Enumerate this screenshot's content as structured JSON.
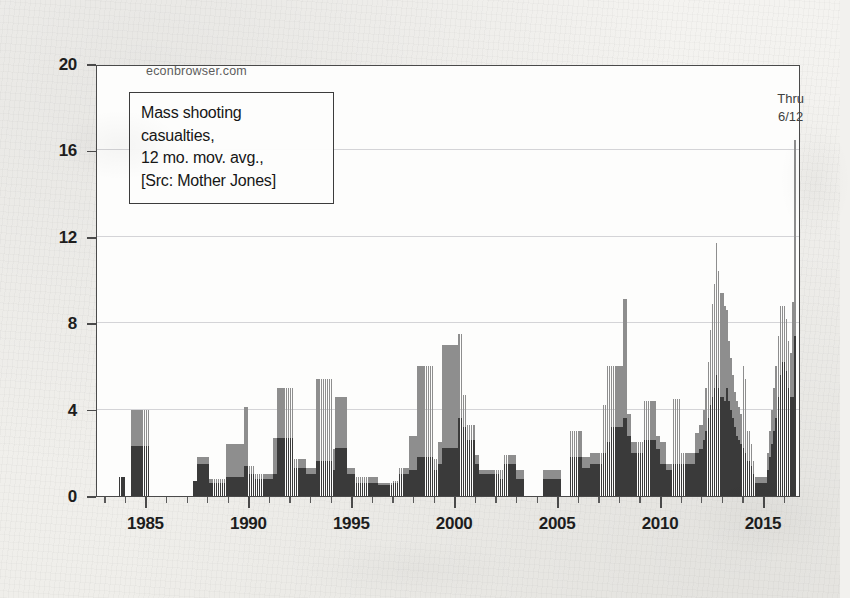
{
  "watermark": "econbrowser.com",
  "annotation": {
    "line1": "Mass shooting",
    "line2": "casualties,",
    "line3": "12 mo. mov. avg.,",
    "line4": "[Src: Mother Jones]"
  },
  "thru_note": {
    "line1": "Thru",
    "line2": "6/12"
  },
  "colors": {
    "fatalities": "#3a3a3a",
    "injuries": "#8e8e8e",
    "axis": "#4a4a4a",
    "grid": "#9a9aa4",
    "paper": "#f2f1ee",
    "plot_background": "#fdfdfc"
  },
  "chart_data": {
    "type": "bar",
    "stacked": true,
    "title": "Mass shooting casualties, 12 mo. mov. avg.",
    "subtitle": "[Src: Mother Jones]",
    "source": "Mother Jones",
    "publisher": "econbrowser.com",
    "annotation_note": "Thru 6/12",
    "xlabel": "",
    "ylabel": "",
    "xlim": [
      1982.6,
      2016.8
    ],
    "ylim": [
      0,
      20
    ],
    "yticks": [
      0,
      4,
      8,
      12,
      16,
      20
    ],
    "xticks": [
      1985,
      1990,
      1995,
      2000,
      2005,
      2010,
      2015
    ],
    "x_minor_tick_interval": 1,
    "grid": "horizontal",
    "legend": "none",
    "bar_interval_years": 0.0833,
    "series": [
      {
        "name": "fatalities",
        "color": "#3a3a3a",
        "stack_order": 0
      },
      {
        "name": "injuries",
        "color": "#8e8e8e",
        "stack_order": 1
      }
    ],
    "x": [
      1983.0,
      1983.1,
      1983.2,
      1983.3,
      1983.4,
      1983.5,
      1983.6,
      1983.7,
      1983.8,
      1983.9,
      1984.0,
      1984.1,
      1984.2,
      1984.3,
      1984.4,
      1984.5,
      1984.6,
      1984.7,
      1984.8,
      1984.9,
      1985.0,
      1985.1,
      1985.2,
      1985.3,
      1985.4,
      1985.5,
      1985.6,
      1985.7,
      1985.8,
      1985.9,
      1986.0,
      1986.1,
      1986.2,
      1986.3,
      1986.4,
      1986.5,
      1986.6,
      1986.7,
      1986.8,
      1986.9,
      1987.0,
      1987.1,
      1987.2,
      1987.3,
      1987.4,
      1987.5,
      1987.6,
      1987.7,
      1987.8,
      1987.9,
      1988.0,
      1988.1,
      1988.2,
      1988.3,
      1988.4,
      1988.5,
      1988.6,
      1988.7,
      1988.8,
      1988.9,
      1989.0,
      1989.1,
      1989.2,
      1989.3,
      1989.4,
      1989.5,
      1989.6,
      1989.7,
      1989.8,
      1989.9,
      1990.0,
      1990.1,
      1990.2,
      1990.3,
      1990.4,
      1990.5,
      1990.6,
      1990.7,
      1990.8,
      1990.9,
      1991.0,
      1991.1,
      1991.2,
      1991.3,
      1991.4,
      1991.5,
      1991.6,
      1991.7,
      1991.8,
      1991.9,
      1992.0,
      1992.1,
      1992.2,
      1992.3,
      1992.4,
      1992.5,
      1992.6,
      1992.7,
      1992.8,
      1992.9,
      1993.0,
      1993.1,
      1993.2,
      1993.3,
      1993.4,
      1993.5,
      1993.6,
      1993.7,
      1993.8,
      1993.9,
      1994.0,
      1994.1,
      1994.2,
      1994.3,
      1994.4,
      1994.5,
      1994.6,
      1994.7,
      1994.8,
      1994.9,
      1995.0,
      1995.1,
      1995.2,
      1995.3,
      1995.4,
      1995.5,
      1995.6,
      1995.7,
      1995.8,
      1995.9,
      1996.0,
      1996.1,
      1996.2,
      1996.3,
      1996.4,
      1996.5,
      1996.6,
      1996.7,
      1996.8,
      1996.9,
      1997.0,
      1997.1,
      1997.2,
      1997.3,
      1997.4,
      1997.5,
      1997.6,
      1997.7,
      1997.8,
      1997.9,
      1998.0,
      1998.1,
      1998.2,
      1998.3,
      1998.4,
      1998.5,
      1998.6,
      1998.7,
      1998.8,
      1998.9,
      1999.0,
      1999.1,
      1999.2,
      1999.3,
      1999.4,
      1999.5,
      1999.6,
      1999.7,
      1999.8,
      1999.9,
      2000.0,
      2000.1,
      2000.2,
      2000.3,
      2000.4,
      2000.5,
      2000.6,
      2000.7,
      2000.8,
      2000.9,
      2001.0,
      2001.1,
      2001.2,
      2001.3,
      2001.4,
      2001.5,
      2001.6,
      2001.7,
      2001.8,
      2001.9,
      2002.0,
      2002.1,
      2002.2,
      2002.3,
      2002.4,
      2002.5,
      2002.6,
      2002.7,
      2002.8,
      2002.9,
      2003.0,
      2003.1,
      2003.2,
      2003.3,
      2003.4,
      2003.5,
      2003.6,
      2003.7,
      2003.8,
      2003.9,
      2004.0,
      2004.1,
      2004.2,
      2004.3,
      2004.4,
      2004.5,
      2004.6,
      2004.7,
      2004.8,
      2004.9,
      2005.0,
      2005.1,
      2005.2,
      2005.3,
      2005.4,
      2005.5,
      2005.6,
      2005.7,
      2005.8,
      2005.9,
      2006.0,
      2006.1,
      2006.2,
      2006.3,
      2006.4,
      2006.5,
      2006.6,
      2006.7,
      2006.8,
      2006.9,
      2007.0,
      2007.1,
      2007.2,
      2007.3,
      2007.4,
      2007.5,
      2007.6,
      2007.7,
      2007.8,
      2007.9,
      2008.0,
      2008.1,
      2008.2,
      2008.3,
      2008.4,
      2008.5,
      2008.6,
      2008.7,
      2008.8,
      2008.9,
      2009.0,
      2009.1,
      2009.2,
      2009.3,
      2009.4,
      2009.5,
      2009.6,
      2009.7,
      2009.8,
      2009.9,
      2010.0,
      2010.1,
      2010.2,
      2010.3,
      2010.4,
      2010.5,
      2010.6,
      2010.7,
      2010.8,
      2010.9,
      2011.0,
      2011.1,
      2011.2,
      2011.3,
      2011.4,
      2011.5,
      2011.6,
      2011.7,
      2011.8,
      2011.9,
      2012.0,
      2012.1,
      2012.2,
      2012.3,
      2012.4,
      2012.5,
      2012.6,
      2012.7,
      2012.8,
      2012.9,
      2013.0,
      2013.1,
      2013.2,
      2013.3,
      2013.4,
      2013.5,
      2013.6,
      2013.7,
      2013.8,
      2013.9,
      2014.0,
      2014.1,
      2014.2,
      2014.3,
      2014.4,
      2014.5,
      2014.6,
      2014.7,
      2014.8,
      2014.9,
      2015.0,
      2015.1,
      2015.2,
      2015.3,
      2015.4,
      2015.5,
      2015.6,
      2015.7,
      2015.8,
      2015.9,
      2016.0,
      2016.1,
      2016.2,
      2016.3,
      2016.4,
      2016.5
    ],
    "fatalities": [
      0,
      0,
      0,
      0,
      0,
      0,
      0,
      0.9,
      0.9,
      0.9,
      0,
      0,
      0,
      2.3,
      2.3,
      2.3,
      2.3,
      2.3,
      2.3,
      2.3,
      2.3,
      2.3,
      0,
      0,
      0,
      0,
      0,
      0,
      0,
      0,
      0,
      0,
      0,
      0,
      0,
      0,
      0,
      0,
      0,
      0,
      0,
      0,
      0,
      0.7,
      0.7,
      1.5,
      1.5,
      1.5,
      1.5,
      1.5,
      1.5,
      0.6,
      0.6,
      0.6,
      0.6,
      0.6,
      0.6,
      0.6,
      0.6,
      0.9,
      0.9,
      0.9,
      0.9,
      0.9,
      0.9,
      0.9,
      0.9,
      0.9,
      1.4,
      1.4,
      1.0,
      1.0,
      1.0,
      0.8,
      0.8,
      0.8,
      0.8,
      0.8,
      0.8,
      0.8,
      0.8,
      0.8,
      1.0,
      1.0,
      2.7,
      2.7,
      2.7,
      2.7,
      2.7,
      2.7,
      2.7,
      2.7,
      1.3,
      1.3,
      1.3,
      1.3,
      1.3,
      1.3,
      1.0,
      1.0,
      1.0,
      1.0,
      1.0,
      1.6,
      1.6,
      1.6,
      1.6,
      1.6,
      1.6,
      1.6,
      1.6,
      1.2,
      2.2,
      2.2,
      2.2,
      2.2,
      2.2,
      2.2,
      1.0,
      1.0,
      1.0,
      1.0,
      0.6,
      0.6,
      0.6,
      0.6,
      0.6,
      0.6,
      0.6,
      0.6,
      0.6,
      0.6,
      0.6,
      0.5,
      0.5,
      0.5,
      0.5,
      0.5,
      0.5,
      0.5,
      0.6,
      0.6,
      0.6,
      1.0,
      1.0,
      1.0,
      1.0,
      1.0,
      1.2,
      1.2,
      1.2,
      1.2,
      1.8,
      1.8,
      1.8,
      1.8,
      1.8,
      1.8,
      1.8,
      1.8,
      1.2,
      1.2,
      1.5,
      1.5,
      2.2,
      2.2,
      2.2,
      2.2,
      2.2,
      2.2,
      2.2,
      2.2,
      3.6,
      3.6,
      3.2,
      3.2,
      2.6,
      2.6,
      2.6,
      2.6,
      1.5,
      1.5,
      1.0,
      1.0,
      1.0,
      1.0,
      1.0,
      1.0,
      1.0,
      1.0,
      1.0,
      1.0,
      0.8,
      0.8,
      1.5,
      1.5,
      1.5,
      1.5,
      1.5,
      1.5,
      0.8,
      0.8,
      0.8,
      0.8,
      0,
      0,
      0,
      0,
      0,
      0,
      0,
      0,
      0,
      0.8,
      0.8,
      0.8,
      0.8,
      0.8,
      0.8,
      0.8,
      0.8,
      0.8,
      0,
      0,
      0,
      0,
      1.8,
      1.8,
      1.8,
      1.8,
      1.8,
      1.8,
      1.3,
      1.3,
      1.3,
      1.3,
      1.5,
      1.5,
      1.5,
      1.5,
      1.5,
      1.5,
      2.0,
      2.0,
      2.5,
      2.5,
      3.2,
      3.2,
      3.2,
      3.2,
      3.2,
      3.2,
      3.6,
      3.6,
      2.8,
      2.8,
      2.0,
      2.0,
      2.0,
      2.0,
      2.0,
      2.0,
      2.6,
      2.6,
      2.6,
      2.6,
      2.6,
      2.6,
      2.2,
      2.2,
      1.5,
      1.5,
      1.5,
      1.2,
      1.2,
      1.2,
      1.5,
      1.5,
      1.5,
      1.5,
      1.5,
      1.5,
      1.5,
      1.5,
      1.5,
      1.5,
      1.5,
      2.0,
      2.0,
      2.2,
      2.2,
      2.6,
      3.0,
      3.6,
      4.2,
      4.6,
      5.0,
      5.6,
      5.0,
      4.6,
      4.6,
      4.4,
      5.0,
      4.4,
      4.0,
      3.6,
      3.2,
      2.8,
      2.6,
      2.4,
      2.2,
      2.0,
      1.6,
      1.6,
      1.4,
      1.0,
      0.6,
      0.6,
      0.6,
      0.6,
      0.6,
      0.6,
      1.2,
      1.8,
      2.4,
      3.0,
      3.6,
      4.6,
      5.6,
      6.2,
      6.2,
      5.8,
      5.0,
      4.6,
      4.6,
      7.4
    ],
    "injuries": [
      0,
      0,
      0,
      0,
      0,
      0,
      0,
      0,
      0,
      0,
      0,
      0,
      0,
      1.7,
      1.7,
      1.7,
      1.7,
      1.7,
      1.7,
      1.7,
      1.7,
      1.7,
      0,
      0,
      0,
      0,
      0,
      0,
      0,
      0,
      0,
      0,
      0,
      0,
      0,
      0,
      0,
      0,
      0,
      0,
      0,
      0,
      0,
      0,
      0,
      0.3,
      0.3,
      0.3,
      0.3,
      0.3,
      0.3,
      0.2,
      0.2,
      0.2,
      0.2,
      0.2,
      0.2,
      0.2,
      0.2,
      1.5,
      1.5,
      1.5,
      1.5,
      1.5,
      1.5,
      1.5,
      1.5,
      1.5,
      2.7,
      2.7,
      0.4,
      0.4,
      0.4,
      0.2,
      0.2,
      0.2,
      0.2,
      0.2,
      0.2,
      0.2,
      0.2,
      0.2,
      1.7,
      1.7,
      2.3,
      2.3,
      2.3,
      2.3,
      2.3,
      2.3,
      2.3,
      2.3,
      0.4,
      0.4,
      0.4,
      0.4,
      0.4,
      0.4,
      0.3,
      0.3,
      0.3,
      0.3,
      0.3,
      3.8,
      3.8,
      3.8,
      3.8,
      3.8,
      3.8,
      3.8,
      3.8,
      1.0,
      2.4,
      2.4,
      2.4,
      2.4,
      2.4,
      2.4,
      0.3,
      0.3,
      0.3,
      0.3,
      0.3,
      0.3,
      0.3,
      0.3,
      0.3,
      0.3,
      0.3,
      0.3,
      0.3,
      0.3,
      0.3,
      0.1,
      0.1,
      0.1,
      0.1,
      0.1,
      0.1,
      0.1,
      0.1,
      0.1,
      0.1,
      0.3,
      0.3,
      0.3,
      0.3,
      0.3,
      1.6,
      1.6,
      1.6,
      1.6,
      4.2,
      4.2,
      4.2,
      4.2,
      4.2,
      4.2,
      4.2,
      4.2,
      0.5,
      0.5,
      1.0,
      1.0,
      4.8,
      4.8,
      4.8,
      4.8,
      4.8,
      4.8,
      4.8,
      4.8,
      3.9,
      3.9,
      1.5,
      1.5,
      0.7,
      0.7,
      0.7,
      0.7,
      0.4,
      0.4,
      0.2,
      0.2,
      0.2,
      0.2,
      0.2,
      0.2,
      0.2,
      0.2,
      0.2,
      0.2,
      0.4,
      0.4,
      0.4,
      0.4,
      0.4,
      0.4,
      0.4,
      0.4,
      0.4,
      0.4,
      0.4,
      0.4,
      0,
      0,
      0,
      0,
      0,
      0,
      0,
      0,
      0,
      0.4,
      0.4,
      0.4,
      0.4,
      0.4,
      0.4,
      0.4,
      0.4,
      0.4,
      0,
      0,
      0,
      0,
      1.2,
      1.2,
      1.2,
      1.2,
      1.2,
      1.2,
      0.5,
      0.5,
      0.5,
      0.5,
      0.5,
      0.5,
      0.5,
      0.5,
      0.5,
      0.5,
      2.2,
      2.2,
      3.5,
      3.5,
      2.8,
      2.8,
      2.8,
      2.8,
      2.8,
      2.8,
      5.5,
      5.5,
      1.0,
      1.0,
      0.5,
      0.5,
      0.5,
      0.5,
      0.5,
      0.5,
      1.8,
      1.8,
      1.8,
      1.8,
      1.8,
      1.8,
      0.6,
      0.6,
      1.0,
      1.0,
      1.0,
      0.3,
      0.3,
      0.3,
      3.0,
      3.0,
      3.0,
      3.0,
      0.5,
      0.5,
      0.5,
      0.5,
      0.5,
      0.5,
      0.5,
      0.9,
      0.9,
      1.1,
      1.1,
      1.4,
      2.0,
      2.6,
      3.5,
      4.3,
      4.8,
      6.1,
      5.4,
      4.8,
      4.8,
      4.4,
      3.6,
      2.8,
      2.4,
      2.0,
      1.6,
      1.6,
      1.5,
      1.4,
      3.8,
      3.4,
      1.4,
      1.4,
      1.0,
      0.6,
      0.3,
      0.3,
      0.3,
      0.3,
      0.3,
      0.3,
      0.8,
      1.2,
      1.6,
      2.0,
      2.4,
      2.8,
      3.2,
      2.6,
      2.6,
      2.4,
      2.2,
      2.0,
      4.4,
      9.1
    ]
  }
}
